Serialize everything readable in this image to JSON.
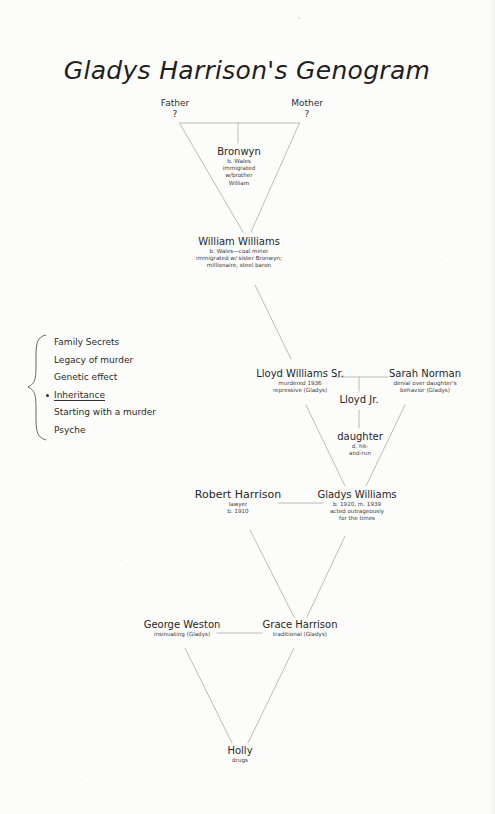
{
  "title": "Gladys Harrison's Genogram",
  "colors": {
    "paper": "#fcfcfa",
    "ink": "#2a2a2a",
    "line": "#b4b4b4"
  },
  "generation_1": {
    "father": {
      "label": "Father",
      "value": "?"
    },
    "mother": {
      "label": "Mother",
      "value": "?"
    }
  },
  "people": {
    "bronwyn": {
      "name": "Bronwyn",
      "notes": [
        "b. Wales",
        "immigrated",
        "w/brother",
        "William"
      ]
    },
    "william_williams": {
      "name": "William Williams",
      "notes": [
        "b. Wales—coal miner",
        "immigrated w/ sister Bronwyn;",
        "millionaire, steel baron"
      ]
    },
    "lloyd_williams_sr": {
      "name": "Lloyd Williams Sr.",
      "notes": [
        "murdered 1936",
        "repressive (Gladys)"
      ]
    },
    "sarah_norman": {
      "name": "Sarah Norman",
      "notes": [
        "denial over daughter's",
        "behavior (Gladys)"
      ]
    },
    "lloyd_jr": {
      "name": "Lloyd Jr.",
      "notes": []
    },
    "daughter": {
      "name": "daughter",
      "notes": [
        "d. hit-",
        "and-run"
      ]
    },
    "robert_harrison": {
      "name": "Robert Harrison",
      "notes": [
        "lawyer",
        "b. 1910"
      ]
    },
    "gladys_williams": {
      "name": "Gladys Williams",
      "notes": [
        "b. 1920, m. 1939",
        "acted outrageously",
        "for the times"
      ]
    },
    "george_weston": {
      "name": "George Weston",
      "notes": [
        "insinuating (Gladys)"
      ]
    },
    "grace_harrison": {
      "name": "Grace Harrison",
      "notes": [
        "traditional (Gladys)"
      ]
    },
    "holly": {
      "name": "Holly",
      "notes": [
        "drugs"
      ]
    }
  },
  "themes": {
    "items": [
      {
        "label": "Family Secrets",
        "selected": false
      },
      {
        "label": "Legacy of murder",
        "selected": false
      },
      {
        "label": "Genetic effect",
        "selected": false
      },
      {
        "label": "Inheritance",
        "selected": true
      },
      {
        "label": "Starting with a murder",
        "selected": false
      },
      {
        "label": "Psyche",
        "selected": false
      }
    ]
  }
}
